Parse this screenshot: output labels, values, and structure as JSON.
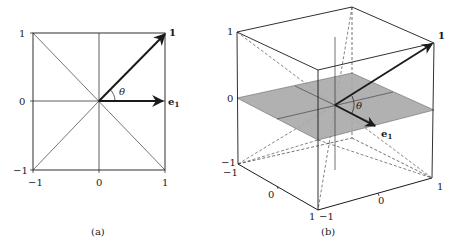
{
  "figure": {
    "panel_a": {
      "caption": "(a)",
      "x_ticks": [
        "−1",
        "0",
        "1"
      ],
      "y_ticks": [
        "−1",
        "0",
        "1"
      ],
      "vector_one_label": "1",
      "vector_e1_label": "e",
      "vector_e1_sub": "1",
      "angle_label": "θ"
    },
    "panel_b": {
      "caption": "(b)",
      "z_ticks": [
        "−1",
        "0",
        "1"
      ],
      "front_left_ticks": [
        "−1",
        "0",
        "1"
      ],
      "front_right_ticks": [
        "−1",
        "0",
        "1"
      ],
      "vector_one_label": "1",
      "vector_e1_label": "e",
      "vector_e1_sub": "1",
      "angle_label": "θ",
      "plane_color": "#a8a8a8"
    },
    "colors": {
      "line": "#1a1a1a",
      "thin_line": "#333333",
      "background": "#ffffff"
    }
  }
}
